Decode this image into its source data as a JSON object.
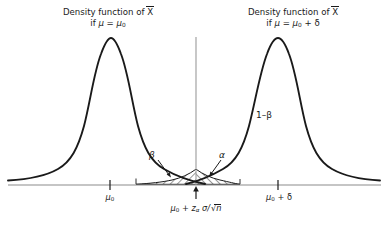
{
  "figure": {
    "type": "statistical-distribution-diagram",
    "background": "#ffffff",
    "curve_color": "#1a1a1a",
    "axis_color": "#8c8c8c",
    "hatch_color": "#1a1a1a"
  },
  "labels": {
    "left_caption_line1": "Density function of X",
    "left_caption_line2_prefix": "if ",
    "left_caption_mu": "μ",
    "left_caption_eq": " = ",
    "left_caption_mu0": "μ",
    "left_caption_mu0_sub": "0",
    "right_caption_line1": "Density function of X",
    "right_caption_line2_prefix": "if ",
    "right_caption_mu": "μ",
    "right_caption_eq": " = ",
    "right_caption_mu0": "μ",
    "right_caption_mu0_sub": "0",
    "right_caption_plus_delta": " + δ",
    "power_label": "1–β",
    "beta_label": "β",
    "alpha_label": "α",
    "tick_left_mu": "μ",
    "tick_left_sub": "0",
    "tick_right_mu": "μ",
    "tick_right_sub": "0",
    "tick_right_rest": " + δ",
    "tick_center_mu": "μ",
    "tick_center_sub": "0",
    "tick_center_plus": " + ",
    "tick_center_z": "z",
    "tick_center_z_sub": "α",
    "tick_center_sigma": " σ/",
    "tick_center_sqrt": "√",
    "tick_center_n": "n",
    "x_bar_symbol": "X"
  },
  "chart_data": {
    "type": "line",
    "xlabel": "",
    "ylabel": "",
    "grid": false,
    "legend_position": "inline-annotations",
    "axis": {
      "baseline_y_px": 185,
      "x_start_px": 8,
      "x_end_px": 381,
      "critical_line_x_px": 196,
      "critical_line_top_px": 37
    },
    "series": [
      {
        "name": "Density function of X̄ if μ = μ₀",
        "distribution": "normal",
        "mean_label": "μ₀",
        "mean_x_px": 110,
        "peak_y_px": 38,
        "sd_px": 33,
        "tail_start_px": 8,
        "tail_end_px": 205
      },
      {
        "name": "Density function of X̄ if μ = μ₀ + δ",
        "distribution": "normal",
        "mean_label": "μ₀ + δ",
        "mean_x_px": 278,
        "peak_y_px": 38,
        "sd_px": 33,
        "tail_start_px": 186,
        "tail_end_px": 381
      }
    ],
    "regions": [
      {
        "name": "beta",
        "label": "β",
        "description": "Type II error area: left of critical value under alternative distribution",
        "x_from_px": 136,
        "x_to_px": 196,
        "hatched": true
      },
      {
        "name": "alpha",
        "label": "α",
        "description": "Type I error area: right of critical value under null distribution",
        "x_from_px": 196,
        "x_to_px": 240,
        "hatched": true
      },
      {
        "name": "power",
        "label": "1–β",
        "description": "Power: area right of critical value under alternative distribution"
      }
    ],
    "ticks": [
      {
        "label": "μ₀",
        "x_px": 110
      },
      {
        "label": "μ₀ + zα σ/√n",
        "x_px": 196
      },
      {
        "label": "μ₀ + δ",
        "x_px": 278
      }
    ]
  }
}
